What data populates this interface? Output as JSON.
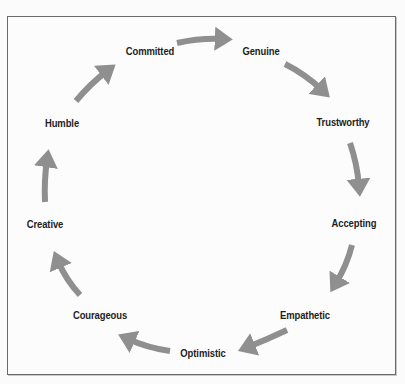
{
  "diagram": {
    "type": "cycle",
    "arrow_color": "#8f8f8f",
    "border_color": "#6a6a6a",
    "nodes": [
      {
        "id": "committed",
        "label": "Committed",
        "x": 150,
        "y": 51
      },
      {
        "id": "genuine",
        "label": "Genuine",
        "x": 261,
        "y": 51
      },
      {
        "id": "trustworthy",
        "label": "Trustworthy",
        "x": 343,
        "y": 122
      },
      {
        "id": "accepting",
        "label": "Accepting",
        "x": 354,
        "y": 223
      },
      {
        "id": "empathetic",
        "label": "Empathetic",
        "x": 305,
        "y": 315
      },
      {
        "id": "optimistic",
        "label": "Optimistic",
        "x": 203,
        "y": 353
      },
      {
        "id": "courageous",
        "label": "Courageous",
        "x": 100,
        "y": 315
      },
      {
        "id": "creative",
        "label": "Creative",
        "x": 45,
        "y": 224
      },
      {
        "id": "humble",
        "label": "Humble",
        "x": 62,
        "y": 123
      }
    ],
    "edges": [
      {
        "from": "committed",
        "to": "genuine"
      },
      {
        "from": "genuine",
        "to": "trustworthy"
      },
      {
        "from": "trustworthy",
        "to": "accepting"
      },
      {
        "from": "accepting",
        "to": "empathetic"
      },
      {
        "from": "empathetic",
        "to": "optimistic"
      },
      {
        "from": "optimistic",
        "to": "courageous"
      },
      {
        "from": "courageous",
        "to": "creative"
      },
      {
        "from": "creative",
        "to": "humble"
      },
      {
        "from": "humble",
        "to": "committed"
      }
    ]
  }
}
